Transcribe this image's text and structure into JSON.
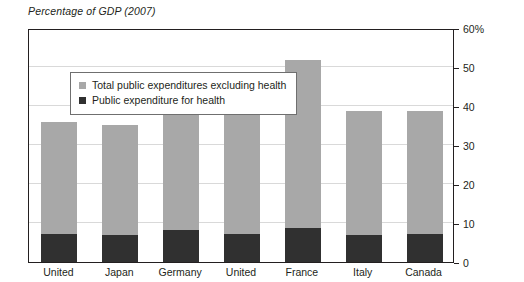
{
  "chart_data": {
    "type": "bar",
    "subtype": "stacked-bar",
    "title": "Percentage of GDP (2007)",
    "xlabel": "",
    "ylabel": "",
    "ylim": [
      0,
      60
    ],
    "ytick_values": [
      0,
      10,
      20,
      30,
      40,
      50,
      60
    ],
    "ytick_labels": [
      "0",
      "10",
      "20",
      "30",
      "40",
      "50",
      "60%"
    ],
    "grid": true,
    "grid_axis": "y",
    "legend_position": "upper-left-inside",
    "categories": [
      "United",
      "Japan",
      "Germany",
      "United",
      "France",
      "Italy",
      "Canada"
    ],
    "series": [
      {
        "name": "Public expenditure for health",
        "color": "#303030",
        "values": [
          7.3,
          6.9,
          8.1,
          7.3,
          8.8,
          6.8,
          7.3
        ]
      },
      {
        "name": "Total public expenditures excluding health",
        "color": "#a8a8a8",
        "values": [
          28.5,
          28.3,
          34.7,
          36.1,
          42.9,
          31.9,
          31.4
        ]
      }
    ],
    "totals": [
      35.8,
      35.2,
      42.8,
      43.4,
      51.7,
      38.7,
      38.7
    ],
    "annotations": []
  },
  "title": {
    "text": "Percentage of GDP (2007)"
  },
  "legend": {
    "items": [
      {
        "label": "Total public expenditures excluding health",
        "color": "#a8a8a8"
      },
      {
        "label": "Public expenditure for health",
        "color": "#303030"
      }
    ]
  },
  "axes": {
    "y": {
      "ticks": [
        {
          "label": "60%",
          "value": 60
        },
        {
          "label": "50",
          "value": 50
        },
        {
          "label": "40",
          "value": 40
        },
        {
          "label": "30",
          "value": 30
        },
        {
          "label": "20",
          "value": 20
        },
        {
          "label": "10",
          "value": 10
        },
        {
          "label": "0",
          "value": 0
        }
      ]
    },
    "x": {
      "ticks": [
        {
          "label": "United"
        },
        {
          "label": "Japan"
        },
        {
          "label": "Germany"
        },
        {
          "label": "United"
        },
        {
          "label": "France"
        },
        {
          "label": "Italy"
        },
        {
          "label": "Canada"
        }
      ]
    }
  },
  "colors": {
    "total_public": "#a8a8a8",
    "health": "#303030",
    "axis": "#231f20",
    "grid": "#d9d9d9",
    "background": "#ffffff"
  }
}
